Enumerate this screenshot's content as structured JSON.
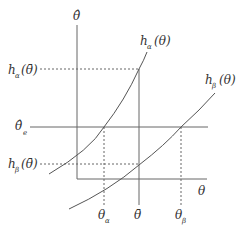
{
  "diagram": {
    "axes": {
      "y_label": "θ̂",
      "x_label": "θ"
    },
    "curves": [
      {
        "name": "h_alpha",
        "label_main": "h",
        "label_sub": "α",
        "label_arg": "(θ)"
      },
      {
        "name": "h_beta",
        "label_main": "h",
        "label_sub": "β",
        "label_arg": "(θ)"
      }
    ],
    "y_markers": [
      {
        "name": "h_alpha_theta_bar",
        "label_main": "h",
        "label_sub": "α",
        "label_arg": "(θ̄)"
      },
      {
        "name": "theta_hat_e",
        "label_main": "θ̂",
        "label_sub": "e"
      },
      {
        "name": "h_beta_theta_bar",
        "label_main": "h",
        "label_sub": "β",
        "label_arg": "(θ̄)"
      }
    ],
    "x_markers": [
      {
        "name": "theta_alpha",
        "label_main": "θ",
        "label_sub": "α"
      },
      {
        "name": "theta_bar",
        "label_main": "θ̄"
      },
      {
        "name": "theta_beta",
        "label_main": "θ",
        "label_sub": "β"
      }
    ],
    "colors": {
      "line": "#555555",
      "text": "#333333"
    }
  }
}
